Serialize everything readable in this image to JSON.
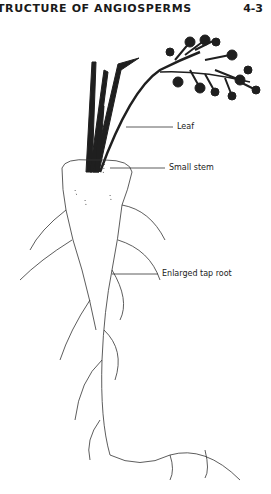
{
  "header": {
    "title": "TRUCTURE OF ANGIOSPERMS",
    "page_number": "4-3"
  },
  "figure": {
    "labels": {
      "leaf": "Leaf",
      "small_stem": "Small stem",
      "tap_root": "Enlarged tap root"
    },
    "colors": {
      "ink": "#1a1a1a",
      "paper": "#ffffff"
    }
  }
}
